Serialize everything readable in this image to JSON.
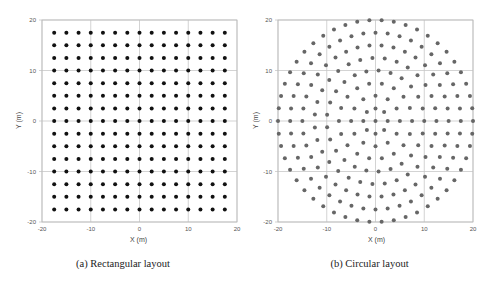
{
  "chart_data": [
    {
      "id": "rect",
      "type": "scatter",
      "title": "",
      "caption": "(a) Rectangular layout",
      "xlabel": "X (m)",
      "ylabel": "Y (m)",
      "xlim": [
        -20,
        20
      ],
      "ylim": [
        -20,
        20
      ],
      "xticks": [
        -20,
        -10,
        0,
        10,
        20
      ],
      "yticks": [
        -20,
        -10,
        0,
        10,
        20
      ],
      "grid": true,
      "marker_color": "#111111",
      "layout": "rectangular",
      "grid_spacing": 2.5,
      "x_positions": [
        -17.5,
        -15,
        -12.5,
        -10,
        -7.5,
        -5,
        -2.5,
        0,
        2.5,
        5,
        7.5,
        10,
        12.5,
        15,
        17.5
      ],
      "y_positions": [
        -17.5,
        -15,
        -12.5,
        -10,
        -7.5,
        -5,
        -2.5,
        0,
        2.5,
        5,
        7.5,
        10,
        12.5,
        15,
        17.5
      ],
      "point_count": 225
    },
    {
      "id": "circ",
      "type": "scatter",
      "title": "",
      "caption": "(b) Circular layout",
      "xlabel": "X (m)",
      "ylabel": "Y (m)",
      "xlim": [
        -20,
        20
      ],
      "ylim": [
        -20,
        20
      ],
      "xticks": [
        -20,
        -10,
        0,
        10,
        20
      ],
      "yticks": [
        -20,
        -10,
        0,
        10,
        20
      ],
      "grid": true,
      "marker_color": "#666666",
      "layout": "concentric_rings",
      "center_point": [
        0,
        0
      ],
      "rings": [
        {
          "radius": 2.5,
          "count": 8
        },
        {
          "radius": 5,
          "count": 12
        },
        {
          "radius": 7.5,
          "count": 18
        },
        {
          "radius": 10,
          "count": 25
        },
        {
          "radius": 12.5,
          "count": 31
        },
        {
          "radius": 15,
          "count": 38
        },
        {
          "radius": 17.5,
          "count": 44
        },
        {
          "radius": 20,
          "count": 50
        }
      ]
    }
  ]
}
